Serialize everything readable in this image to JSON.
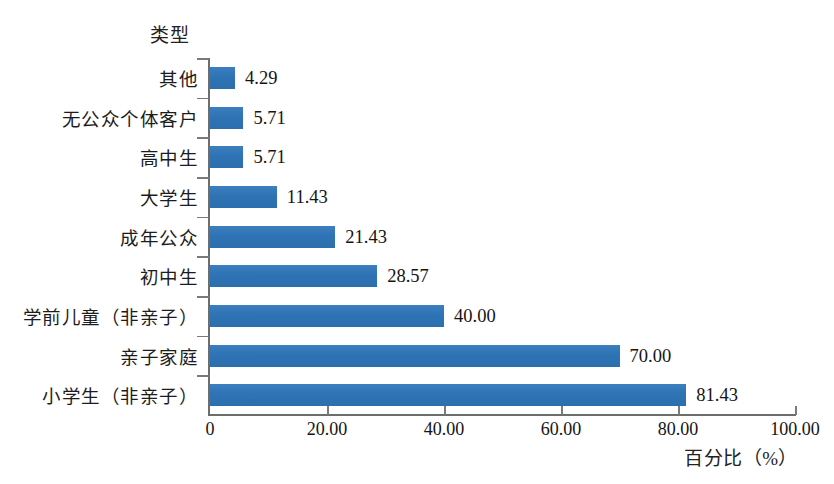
{
  "chart_data": {
    "type": "bar",
    "orientation": "horizontal",
    "title": "",
    "xlabel": "百分比（%）",
    "ylabel": "类型",
    "categories": [
      "其他",
      "无公众个体客户",
      "高中生",
      "大学生",
      "成年公众",
      "初中生",
      "学前儿童（非亲子）",
      "亲子家庭",
      "小学生（非亲子）"
    ],
    "values": [
      4.29,
      5.71,
      5.71,
      11.43,
      21.43,
      28.57,
      40.0,
      70.0,
      81.43
    ],
    "value_labels": [
      "4.29",
      "5.71",
      "5.71",
      "11.43",
      "21.43",
      "28.57",
      "40.00",
      "70.00",
      "81.43"
    ],
    "xlim": [
      0,
      100
    ],
    "xticks": [
      0,
      20,
      40,
      60,
      80,
      100
    ],
    "xtick_labels": [
      "0",
      "20.00",
      "40.00",
      "60.00",
      "80.00",
      "100.00"
    ],
    "grid": false,
    "legend": false,
    "bar_color": "#2E75B6",
    "axis_color": "#6D6D6D",
    "background": "#FFFFFF"
  }
}
